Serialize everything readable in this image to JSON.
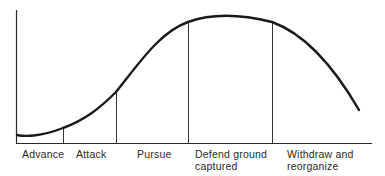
{
  "diagram": {
    "type": "phase-curve",
    "phases": [
      {
        "label": "Advance",
        "start_x": 16,
        "end_x": 63
      },
      {
        "label": "Attack",
        "start_x": 63,
        "end_x": 116
      },
      {
        "label": "Pursue",
        "start_x": 116,
        "end_x": 188
      },
      {
        "label": "Defend ground captured",
        "line1": "Defend ground",
        "line2": "captured",
        "start_x": 188,
        "end_x": 272
      },
      {
        "label": "Withdraw and reorganize",
        "line1": "Withdraw and",
        "line2": "reorganize",
        "start_x": 272,
        "end_x": 372
      }
    ],
    "curve_points": [
      [
        17,
        135
      ],
      [
        30,
        136
      ],
      [
        63,
        128
      ],
      [
        116,
        92
      ],
      [
        188,
        22
      ],
      [
        240,
        16
      ],
      [
        272,
        22
      ],
      [
        359,
        110
      ]
    ],
    "line_color": "#1a1a1a"
  }
}
